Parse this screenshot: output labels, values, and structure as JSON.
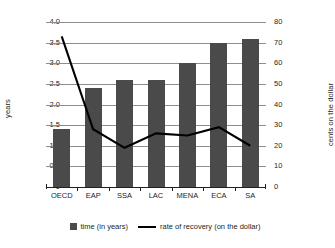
{
  "chart_data": {
    "type": "bar",
    "title": "",
    "subtitle": "",
    "categories": [
      "OECD",
      "EAP",
      "SSA",
      "LAC",
      "MENA",
      "ECA",
      "SA"
    ],
    "series": [
      {
        "name": "time (in years)",
        "type": "bar",
        "axis": "left",
        "color": "#4a4a4a",
        "values": [
          1.4,
          2.4,
          2.6,
          2.6,
          3.0,
          3.5,
          3.6
        ]
      },
      {
        "name": "rate of recovery (on the dollar)",
        "type": "line",
        "axis": "right",
        "color": "#000000",
        "values": [
          73,
          28,
          19,
          26,
          25,
          29,
          20
        ]
      }
    ],
    "xlabel": "",
    "ylabel": "years",
    "y2label": "cents on the dollar",
    "ylim": [
      0,
      4.0
    ],
    "y2lim": [
      0,
      80
    ],
    "yticks": [
      "0",
      "0.5",
      "1.0",
      "1.5",
      "2.0",
      "2.5",
      "3.0",
      "3.5",
      "4.0"
    ],
    "ytick_values": [
      0,
      0.5,
      1.0,
      1.5,
      2.0,
      2.5,
      3.0,
      3.5,
      4.0
    ],
    "y2ticks": [
      "0",
      "10",
      "20",
      "30",
      "40",
      "50",
      "60",
      "70",
      "80"
    ],
    "y2tick_values": [
      0,
      10,
      20,
      30,
      40,
      50,
      60,
      70,
      80
    ],
    "grid": true,
    "legend_position": "bottom"
  },
  "axes": {
    "left_title": "years",
    "right_title": "cents on the dollar"
  },
  "legend": {
    "items": [
      {
        "label": "time (in years)",
        "marker": "square-swatch-icon"
      },
      {
        "label": "rate of recovery (on the dollar)",
        "marker": "line-swatch-icon"
      }
    ]
  }
}
